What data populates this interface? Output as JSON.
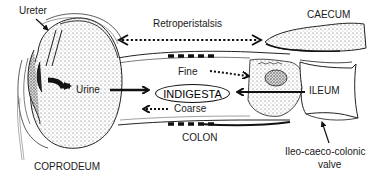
{
  "diagram": {
    "labels": {
      "ureter": "Ureter",
      "retroperistalsis": "Retroperistalsis",
      "caecum": "CAECUM",
      "urine": "Urine",
      "fine": "Fine",
      "indigesta": "INDIGESTA",
      "ileum": "ILEUM",
      "coarse": "Coarse",
      "colon": "COLON",
      "coprodeum": "COPRODEUM",
      "valve_line1": "Ileo-caeco-colonic",
      "valve_line2": "valve"
    },
    "arrows": [
      {
        "name": "retroperistalsis",
        "style": "dotted",
        "direction": "bidirectional"
      },
      {
        "name": "urine-flow",
        "style": "solid",
        "direction": "coprodeum-to-colon"
      },
      {
        "name": "fine-particles",
        "style": "dotted",
        "direction": "to-caecum"
      },
      {
        "name": "coarse-particles",
        "style": "dotted",
        "direction": "to-coprodeum"
      },
      {
        "name": "ileum-input",
        "style": "solid",
        "direction": "to-indigesta"
      },
      {
        "name": "ureter-pointer",
        "style": "solid"
      },
      {
        "name": "valve-pointer",
        "style": "solid"
      }
    ],
    "colors": {
      "ink": "#111111",
      "background": "#ffffff",
      "stipple": "#9a9a9a"
    }
  }
}
